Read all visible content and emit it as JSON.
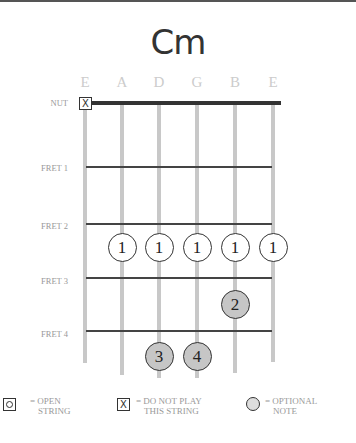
{
  "chord": {
    "name": "Cm"
  },
  "strings": [
    "E",
    "A",
    "D",
    "G",
    "B",
    "E"
  ],
  "nut_label": "NUT",
  "nut_markers": [
    {
      "string": 0,
      "type": "do-not-play",
      "glyph": "X"
    }
  ],
  "frets": [
    "FRET 1",
    "FRET 2",
    "FRET 3",
    "FRET 4"
  ],
  "fingers": [
    {
      "string": 1,
      "fret": 3,
      "finger": "1",
      "style": "open"
    },
    {
      "string": 2,
      "fret": 3,
      "finger": "1",
      "style": "open"
    },
    {
      "string": 3,
      "fret": 3,
      "finger": "1",
      "style": "open"
    },
    {
      "string": 4,
      "fret": 3,
      "finger": "1",
      "style": "open"
    },
    {
      "string": 5,
      "fret": 3,
      "finger": "1",
      "style": "open"
    },
    {
      "string": 4,
      "fret": 4,
      "finger": "2",
      "style": "filled"
    },
    {
      "string": 2,
      "fret": 5,
      "finger": "3",
      "style": "filled"
    },
    {
      "string": 3,
      "fret": 5,
      "finger": "4",
      "style": "filled"
    }
  ],
  "legend": {
    "open": {
      "glyph": "O",
      "line1": "= OPEN",
      "line2": "STRING"
    },
    "mute": {
      "glyph": "X",
      "line1": "= DO NOT PLAY",
      "line2": "THIS STRING"
    },
    "optional": {
      "line1": "= OPTIONAL",
      "line2": "NOTE"
    }
  },
  "colors": {
    "string": "#c8c8c8",
    "fret": "#444444",
    "filled_note": "#c6c6c6",
    "label": "#999999"
  }
}
